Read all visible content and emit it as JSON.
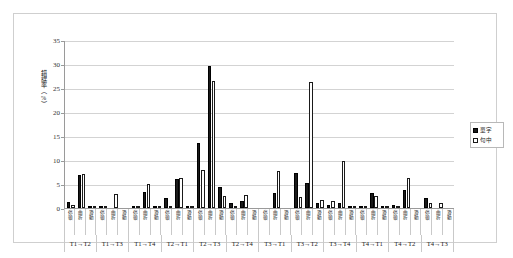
{
  "chart_data": {
    "type": "bar",
    "title": "",
    "xlabel": "",
    "ylabel": "錯誤率（%）",
    "ylim": [
      0,
      35
    ],
    "yticks": [
      0,
      5,
      10,
      15,
      20,
      25,
      30,
      35
    ],
    "grid": true,
    "legend_position": "right",
    "groups": [
      "T1→T2",
      "T1→T3",
      "T1→T4",
      "T2→T1",
      "T2→T3",
      "T2→T4",
      "T3→T1",
      "T3→T2",
      "T3→T4",
      "T4→T1",
      "T4→T2",
      "T4→T3"
    ],
    "categories": [
      "停頓",
      "曲折",
      "滑動",
      "停頓",
      "曲折",
      "滑動",
      "停頓",
      "曲折",
      "滑動",
      "停頓",
      "曲折",
      "滑動",
      "停頓",
      "曲折",
      "滑動",
      "停頓",
      "曲折",
      "滑動",
      "停頓",
      "曲折",
      "滑動",
      "停頓",
      "曲折",
      "滑動",
      "停頓",
      "曲折",
      "滑動",
      "停頓",
      "曲折",
      "滑動",
      "停頓",
      "曲折",
      "滑動",
      "停頓",
      "曲折",
      "滑動"
    ],
    "series": [
      {
        "name": "單字",
        "color": "#1a1a1a",
        "values": [
          1.2,
          6.9,
          0.3,
          0.2,
          0.0,
          0.0,
          0.5,
          3.4,
          0.1,
          2.1,
          6.1,
          0.1,
          13.5,
          29.5,
          4.4,
          1.1,
          1.5,
          0.0,
          0.0,
          3.1,
          0.0,
          7.2,
          5.2,
          1.1,
          0.6,
          1.0,
          0.2,
          0.4,
          3.1,
          0.4,
          0.6,
          3.7,
          0.0,
          2.0,
          0.0,
          0.0
        ]
      },
      {
        "name": "句中",
        "color": "#ffffff",
        "values": [
          0.6,
          7.1,
          0.3,
          0.1,
          2.9,
          0.0,
          0.3,
          4.9,
          0.1,
          0.2,
          6.3,
          0.1,
          8.0,
          26.5,
          2.6,
          0.4,
          2.8,
          0.0,
          0.0,
          7.8,
          0.0,
          2.3,
          26.2,
          1.7,
          1.5,
          9.8,
          0.2,
          0.2,
          2.5,
          0.5,
          0.2,
          6.3,
          0.0,
          1.0,
          1.0,
          0.0
        ]
      }
    ]
  },
  "legend": {
    "items": [
      {
        "label": "單字",
        "key": "dan"
      },
      {
        "label": "句中",
        "key": "ju"
      }
    ]
  }
}
